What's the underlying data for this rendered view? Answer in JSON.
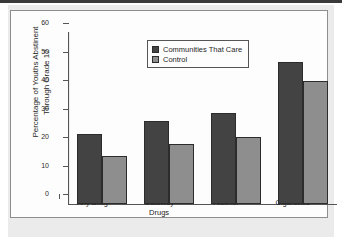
{
  "chart_data": {
    "type": "bar",
    "title": "",
    "subtitle": "",
    "xlabel": "",
    "ylabel": "Percentage of Youths Abstinent\nThrough Grade 12",
    "categories": [
      "Any Drug",
      "Gateway\nDrugs",
      "Alcohol",
      "Cigarettes"
    ],
    "series": [
      {
        "name": "Communities That Care",
        "color": "#434343",
        "values": [
          24.5,
          29,
          32,
          50
        ]
      },
      {
        "name": "Control",
        "color": "#8e8e8e",
        "values": [
          17,
          21,
          23.5,
          43
        ]
      }
    ],
    "ylim": [
      0,
      60
    ],
    "yticks": [
      0,
      10,
      20,
      30,
      40,
      50,
      60
    ],
    "ytick_labels": [
      "0",
      "10",
      "20",
      "30",
      "40",
      "50",
      "60"
    ],
    "grid": false,
    "legend_position": "upper-center"
  },
  "legend": {
    "items": [
      {
        "label": "Communities That Care",
        "swatch": "#434343"
      },
      {
        "label": "Control",
        "swatch": "#8e8e8e"
      }
    ]
  },
  "axis": {
    "y_title_line1": "Percentage of Youths Abstinent",
    "y_title_line2": "Through Grade 12"
  },
  "colors": {
    "series_dark": "#434343",
    "series_light": "#8e8e8e",
    "page_background": "#ebebeb",
    "plot_background": "#fdfdfd",
    "axis_line": "#555555"
  }
}
